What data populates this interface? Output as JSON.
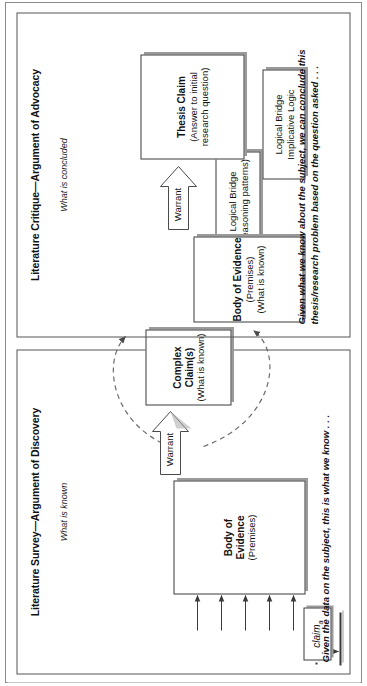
{
  "figure": {
    "orientation": "rotated-90-ccw",
    "panels": [
      {
        "id": "discovery",
        "title": "Literature Survey—Argument of Discovery",
        "subtitle": "What is known",
        "evidence": {
          "title": "Body of\nEvidence",
          "sub": "(Premises)"
        },
        "warrant_label": "Warrant",
        "claim": {
          "title": "Complex Claim(s)",
          "sub": "(What is known)"
        },
        "bridge": {
          "title": "Logical Bridge",
          "sub": "(reasoning patterns)"
        },
        "claim_a": {
          "word": "claim",
          "sub": "a"
        },
        "claim_n": {
          "word": "claim",
          "sub": "n"
        },
        "footnote": "Given the data on the subject, this is what we know . . ."
      },
      {
        "id": "advocacy",
        "title": "Literature Critique—Argument of Advocacy",
        "subtitle": "What is concluded",
        "evidence": {
          "title": "Body of Evidence",
          "sub1": "(Premises)",
          "sub2": "(What is known)"
        },
        "warrant_label": "Warrant",
        "claim": {
          "title": "Thesis Claim",
          "sub1": "(Answer to initial",
          "sub2": "research question)"
        },
        "bridge": {
          "title": "Logical Bridge",
          "sub": "Implicative Logic"
        },
        "footnote": "Given what we know about the subject, we can conclude this thesis/research problem based on the question asked . . ."
      }
    ],
    "colors": {
      "ink": "#111111",
      "box_border": "#3a3a3a",
      "shadow": "#9a9a9a",
      "panel_border": "#555555",
      "page_border": "#8b8b8b",
      "dashed_connector": "#6b6b6b"
    }
  }
}
